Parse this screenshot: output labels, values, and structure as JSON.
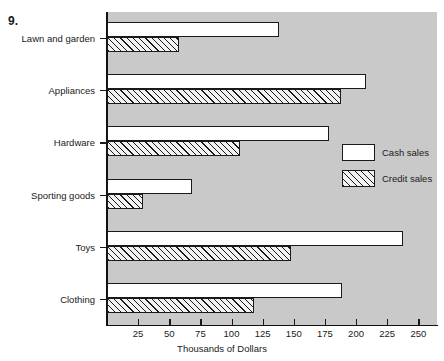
{
  "figure": {
    "number_label": "9."
  },
  "chart_data": {
    "type": "bar",
    "orientation": "horizontal",
    "title": "",
    "xlabel": "Thousands of Dollars",
    "ylabel": "",
    "xlim": [
      0,
      265
    ],
    "xticks": [
      25,
      50,
      75,
      100,
      125,
      150,
      175,
      200,
      225,
      250
    ],
    "grid": false,
    "legend_position": "right-middle",
    "categories": [
      "Lawn and garden",
      "Appliances",
      "Hardware",
      "Sporting goods",
      "Toys",
      "Clothing"
    ],
    "series": [
      {
        "name": "Cash sales",
        "fill": "white",
        "values": [
          138,
          208,
          178,
          68,
          238,
          189
        ]
      },
      {
        "name": "Credit sales",
        "fill": "diagonal-hatch",
        "values": [
          58,
          188,
          107,
          29,
          148,
          118
        ]
      }
    ]
  },
  "legend": {
    "items": [
      {
        "label": "Cash sales",
        "style": "cash"
      },
      {
        "label": "Credit sales",
        "style": "credit"
      }
    ]
  },
  "colors": {
    "plot_background": "#c9c9c9",
    "page_background": "#ffffff",
    "ink": "#1a1a1a",
    "cash_fill": "#ffffff"
  }
}
